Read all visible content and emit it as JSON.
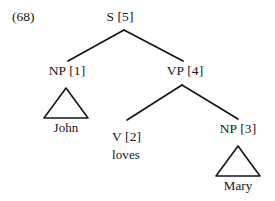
{
  "figure": {
    "example_number": "(68)",
    "type": "syntax-tree",
    "background_color": "#ffffff",
    "ink_color": "#161616"
  },
  "nodes": {
    "root": {
      "label": "S [5]",
      "x": 120,
      "y": 10
    },
    "np1": {
      "label": "NP [1]",
      "x": 67,
      "y": 64
    },
    "vp4": {
      "label": "VP [4]",
      "x": 185,
      "y": 64
    },
    "v2": {
      "label": "V [2]",
      "x": 112,
      "y": 130
    },
    "np3": {
      "label": "NP [3]",
      "x": 238,
      "y": 122
    }
  },
  "leaves": {
    "john": {
      "label": "John",
      "x": 66,
      "y": 121
    },
    "loves": {
      "label": "loves",
      "x": 112,
      "y": 148
    },
    "mary": {
      "label": "Mary",
      "x": 238,
      "y": 179
    }
  },
  "triangles": [
    {
      "name": "np1-triangle",
      "apex_x": 66,
      "apex_y": 88,
      "left_x": 44,
      "right_x": 88,
      "base_y": 118
    },
    {
      "name": "np3-triangle",
      "apex_x": 238,
      "apex_y": 146,
      "left_x": 216,
      "right_x": 260,
      "base_y": 176
    }
  ],
  "branches": [
    {
      "name": "s-to-np1",
      "x1": 124,
      "y1": 30,
      "x2": 68,
      "y2": 61
    },
    {
      "name": "s-to-vp4",
      "x1": 124,
      "y1": 30,
      "x2": 183,
      "y2": 61
    },
    {
      "name": "vp-to-v2",
      "x1": 182,
      "y1": 85,
      "x2": 127,
      "y2": 120
    },
    {
      "name": "vp-to-np3",
      "x1": 182,
      "y1": 85,
      "x2": 238,
      "y2": 119
    }
  ],
  "tree_structure": {
    "label": "S [5]",
    "children": [
      {
        "label": "NP [1]",
        "triangle": true,
        "children": [
          {
            "label": "John",
            "terminal": true
          }
        ]
      },
      {
        "label": "VP [4]",
        "children": [
          {
            "label": "V [2]",
            "children": [
              {
                "label": "loves",
                "terminal": true
              }
            ]
          },
          {
            "label": "NP [3]",
            "triangle": true,
            "children": [
              {
                "label": "Mary",
                "terminal": true
              }
            ]
          }
        ]
      }
    ]
  }
}
